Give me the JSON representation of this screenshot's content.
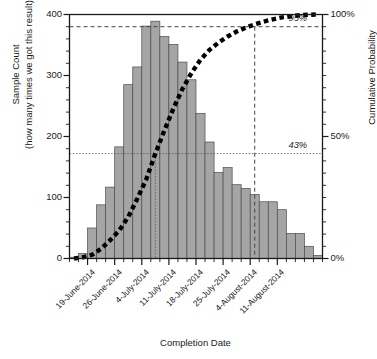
{
  "chart_data": {
    "type": "bar",
    "title": "",
    "xlabel": "Completion Date",
    "ylabel": "Sample Count",
    "ylabel_line1": "Sample Count",
    "ylabel_line2": "(how many times we got this result)",
    "y2label": "Cumulative Probability",
    "ylim": [
      0,
      400
    ],
    "y2lim": [
      0,
      100
    ],
    "grid": false,
    "legend": "none",
    "yticks": [
      0,
      100,
      200,
      300,
      400
    ],
    "ytick_labels": [
      "0",
      "100",
      "200",
      "300",
      "400"
    ],
    "y_minor_step": 20,
    "y2ticks": [
      0,
      50,
      100
    ],
    "y2tick_labels": [
      "0%",
      "50%",
      "100%"
    ],
    "y2_minor_step": 5,
    "xtick_labels": [
      "19-June-2014",
      "26-June-2014",
      "4-July-2014",
      "11-July-2014",
      "18-July-2014",
      "25-July-2014",
      "4-August-2014",
      "11-August-2014"
    ],
    "xtick_bar_index": [
      2,
      5,
      8,
      11,
      14,
      17,
      20,
      23
    ],
    "bar_color": "#a5a5a5",
    "bar_edge_color": "#4d4d4d",
    "curve_color": "#000000",
    "n_bins": 28,
    "values": [
      2,
      8,
      50,
      88,
      117,
      183,
      285,
      314,
      381,
      389,
      364,
      351,
      322,
      293,
      238,
      191,
      141,
      149,
      121,
      115,
      105,
      93,
      93,
      80,
      41,
      41,
      20,
      5
    ],
    "series": [
      {
        "name": "Sample Count",
        "type": "bar",
        "axis": "left",
        "values": [
          2,
          8,
          50,
          88,
          117,
          183,
          285,
          314,
          381,
          389,
          364,
          351,
          322,
          293,
          238,
          191,
          141,
          149,
          121,
          115,
          105,
          93,
          93,
          80,
          41,
          41,
          20,
          5
        ]
      },
      {
        "name": "Cumulative Probability",
        "type": "line",
        "axis": "right",
        "style": "thick-dashed",
        "values": [
          0.0,
          0.5,
          1.5,
          4.0,
          7.5,
          11.5,
          17.0,
          24.5,
          32.5,
          43.0,
          52.5,
          61.5,
          69.5,
          76.0,
          81.5,
          85.5,
          88.5,
          91.0,
          93.0,
          94.6,
          96.0,
          97.1,
          98.0,
          98.8,
          99.3,
          99.7,
          99.9,
          100.0
        ]
      }
    ],
    "annotations": [
      {
        "label": "43%",
        "value": 43,
        "axis": "right",
        "bar_index": 9,
        "line_style": "dotted",
        "style": "italic"
      },
      {
        "label": "95%",
        "value": 95,
        "axis": "right",
        "bar_index": 20,
        "line_style": "dashed",
        "style": "italic"
      }
    ]
  }
}
